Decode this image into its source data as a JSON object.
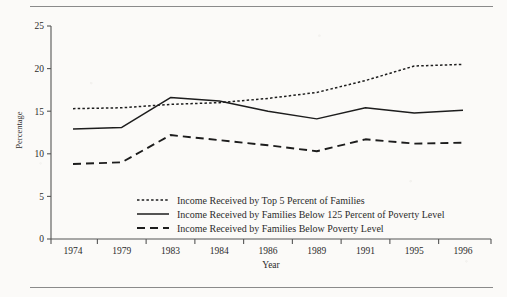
{
  "chart_data": {
    "type": "line",
    "title": "",
    "xlabel": "Year",
    "ylabel": "Percentage",
    "categories": [
      "1974",
      "1979",
      "1983",
      "1984",
      "1986",
      "1989",
      "1991",
      "1995",
      "1996"
    ],
    "ylim": [
      0,
      25
    ],
    "yticks": [
      0,
      5,
      10,
      15,
      20,
      25
    ],
    "grid": false,
    "legend_position": "inside-bottom-center",
    "series": [
      {
        "name": "Income Received by Top 5 Percent of Families",
        "style": "dotted",
        "values": [
          15.3,
          15.4,
          15.8,
          16.0,
          16.5,
          17.2,
          18.6,
          20.3,
          20.5
        ]
      },
      {
        "name": "Income Received by Families Below 125 Percent of Poverty Level",
        "style": "solid",
        "values": [
          12.9,
          13.1,
          16.6,
          16.2,
          15.0,
          14.1,
          15.4,
          14.8,
          15.1
        ]
      },
      {
        "name": "Income Received by Families Below Poverty Level",
        "style": "dashed",
        "values": [
          8.8,
          9.0,
          12.2,
          11.6,
          11.0,
          10.3,
          11.7,
          11.2,
          11.3
        ]
      }
    ]
  },
  "axis": {
    "y_label": "Percentage",
    "x_label": "Year",
    "y_ticks": [
      "0",
      "5",
      "10",
      "15",
      "20",
      "25"
    ],
    "x_ticks": [
      "1974",
      "1979",
      "1983",
      "1984",
      "1986",
      "1989",
      "1991",
      "1995",
      "1996"
    ]
  },
  "legend": {
    "items": [
      {
        "label": "Income Received by Top 5 Percent of Families",
        "style": "dotted"
      },
      {
        "label": "Income Received by Families Below 125 Percent of Poverty Level",
        "style": "solid"
      },
      {
        "label": "Income Received by Families Below Poverty Level",
        "style": "dashed"
      }
    ]
  },
  "colors": {
    "ink": "#1d1d1d",
    "axis": "#555555",
    "rule": "#8a8a8a",
    "paper": "#fbfaf8"
  }
}
